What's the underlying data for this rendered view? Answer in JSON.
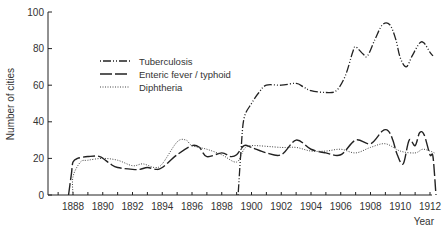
{
  "chart_data": {
    "type": "line",
    "title": "",
    "xlabel": "Year",
    "ylabel": "Number of cities",
    "xlim": [
      1886.5,
      1912.5
    ],
    "ylim": [
      0,
      100
    ],
    "x_ticks": [
      "1888",
      "1890",
      "1892",
      "1894",
      "1896",
      "1898",
      "1900",
      "1902",
      "1904",
      "1906",
      "1908",
      "1910",
      "1912"
    ],
    "y_ticks": [
      "0",
      "20",
      "40",
      "60",
      "80",
      "100"
    ],
    "grid": false,
    "legend_position": "upper-left-inside",
    "series": [
      {
        "name": "Tuberculosis",
        "style": "dash-dot",
        "points": [
          [
            1899.1,
            0
          ],
          [
            1899.3,
            25
          ],
          [
            1899.5,
            42
          ],
          [
            1900,
            50
          ],
          [
            1900.5,
            56
          ],
          [
            1901,
            60
          ],
          [
            1902,
            60
          ],
          [
            1903,
            61
          ],
          [
            1903.5,
            59
          ],
          [
            1904,
            57
          ],
          [
            1905,
            56
          ],
          [
            1905.7,
            57
          ],
          [
            1906.3,
            65
          ],
          [
            1906.8,
            78
          ],
          [
            1907,
            81
          ],
          [
            1907.5,
            77
          ],
          [
            1907.8,
            76
          ],
          [
            1908.3,
            85
          ],
          [
            1908.8,
            93
          ],
          [
            1909.3,
            93
          ],
          [
            1909.7,
            85
          ],
          [
            1910,
            75
          ],
          [
            1910.4,
            70
          ],
          [
            1910.8,
            76
          ],
          [
            1911.3,
            83
          ],
          [
            1911.6,
            83
          ],
          [
            1912,
            78
          ],
          [
            1912.2,
            76
          ]
        ]
      },
      {
        "name": "Enteric fever / typhoid",
        "style": "long-dash",
        "points": [
          [
            1887.7,
            0
          ],
          [
            1887.9,
            12
          ],
          [
            1888,
            18
          ],
          [
            1888.3,
            20
          ],
          [
            1889,
            21
          ],
          [
            1889.8,
            21
          ],
          [
            1890.5,
            17
          ],
          [
            1891,
            15
          ],
          [
            1892,
            14
          ],
          [
            1892.5,
            14
          ],
          [
            1893,
            15
          ],
          [
            1893.6,
            14
          ],
          [
            1894,
            15
          ],
          [
            1895,
            22
          ],
          [
            1896,
            27
          ],
          [
            1896.5,
            26
          ],
          [
            1897,
            21
          ],
          [
            1898,
            23
          ],
          [
            1898.6,
            21
          ],
          [
            1899,
            22
          ],
          [
            1899.5,
            27
          ],
          [
            1900,
            26
          ],
          [
            1901,
            23
          ],
          [
            1902,
            22
          ],
          [
            1903,
            30
          ],
          [
            1904,
            25
          ],
          [
            1905,
            23
          ],
          [
            1906,
            22
          ],
          [
            1907,
            30
          ],
          [
            1908,
            28
          ],
          [
            1908.8,
            35
          ],
          [
            1909.2,
            35
          ],
          [
            1909.5,
            30
          ],
          [
            1909.8,
            22
          ],
          [
            1910.2,
            17
          ],
          [
            1910.6,
            30
          ],
          [
            1911,
            27
          ],
          [
            1911.3,
            34
          ],
          [
            1911.6,
            33
          ],
          [
            1912,
            22
          ],
          [
            1912.2,
            21
          ],
          [
            1912.4,
            0
          ]
        ]
      },
      {
        "name": "Diphtheria",
        "style": "dotted",
        "points": [
          [
            1888,
            0
          ],
          [
            1888,
            10
          ],
          [
            1888.5,
            18
          ],
          [
            1889,
            19
          ],
          [
            1890,
            20
          ],
          [
            1891,
            19
          ],
          [
            1892,
            16
          ],
          [
            1892.7,
            17
          ],
          [
            1893.5,
            15
          ],
          [
            1894,
            17
          ],
          [
            1895,
            29
          ],
          [
            1895.6,
            30
          ],
          [
            1896,
            27
          ],
          [
            1897,
            25
          ],
          [
            1898,
            22
          ],
          [
            1899,
            18
          ],
          [
            1899.5,
            25
          ],
          [
            1900,
            27
          ],
          [
            1902,
            26
          ],
          [
            1903,
            26
          ],
          [
            1904,
            24
          ],
          [
            1905,
            24
          ],
          [
            1906,
            25
          ],
          [
            1907,
            23
          ],
          [
            1908,
            26
          ],
          [
            1909,
            28
          ],
          [
            1910,
            24
          ],
          [
            1911,
            23
          ],
          [
            1911.5,
            25
          ],
          [
            1912,
            24
          ],
          [
            1912.3,
            23
          ]
        ]
      }
    ]
  },
  "legend": {
    "items": [
      {
        "label": "Tuberculosis"
      },
      {
        "label": "Enteric fever / typhoid"
      },
      {
        "label": "Diphtheria"
      }
    ]
  },
  "axes": {
    "ylabel": "Number of cities",
    "xlabel": "Year"
  }
}
